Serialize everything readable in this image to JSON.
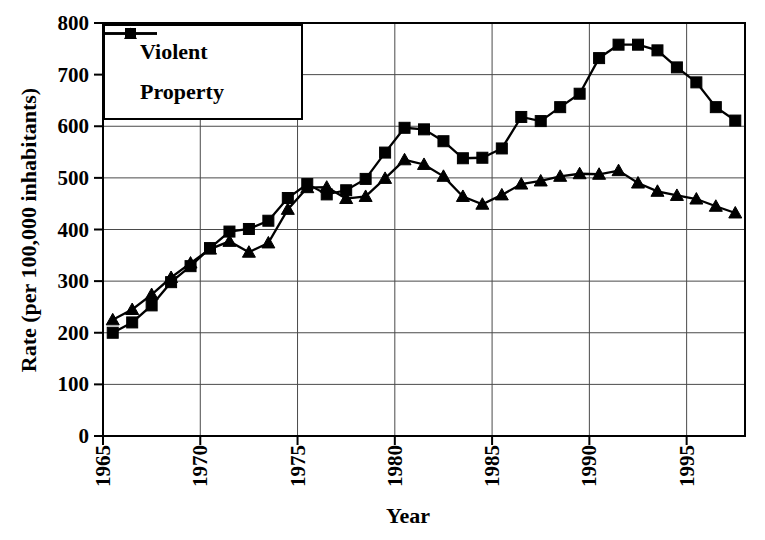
{
  "figure": {
    "background": "#ffffff",
    "line_color": "#000000",
    "grid_color": "#4a4a4a"
  },
  "legend": {
    "items": [
      {
        "label": "Violent",
        "marker": "square"
      },
      {
        "label": "Property",
        "marker": "triangle"
      }
    ]
  },
  "chart_data": {
    "type": "line",
    "title": "",
    "xlabel": "Year",
    "ylabel": "Rate (per 100,000 inhabitants)",
    "ylim": [
      0,
      800
    ],
    "yticks": [
      0,
      100,
      200,
      300,
      400,
      500,
      600,
      700,
      800
    ],
    "xticks": [
      1965,
      1970,
      1975,
      1980,
      1985,
      1990,
      1995
    ],
    "grid": true,
    "legend_position": "top-left-inside",
    "x": [
      1965,
      1966,
      1967,
      1968,
      1969,
      1970,
      1971,
      1972,
      1973,
      1974,
      1975,
      1976,
      1977,
      1978,
      1979,
      1980,
      1981,
      1982,
      1983,
      1984,
      1985,
      1986,
      1987,
      1988,
      1989,
      1990,
      1991,
      1992,
      1993,
      1994,
      1995,
      1996,
      1997
    ],
    "series": [
      {
        "name": "Violent",
        "marker": "square",
        "values": [
          200,
          220,
          253,
          298,
          329,
          364,
          396,
          401,
          417,
          461,
          488,
          468,
          476,
          498,
          549,
          597,
          594,
          571,
          538,
          539,
          557,
          618,
          610,
          637,
          663,
          732,
          758,
          758,
          747,
          714,
          685,
          637,
          611
        ]
      },
      {
        "name": "Property",
        "marker": "triangle",
        "values": [
          225,
          245,
          274,
          307,
          335,
          362,
          377,
          356,
          374,
          439,
          481,
          482,
          460,
          464,
          499,
          535,
          526,
          503,
          464,
          449,
          467,
          488,
          494,
          503,
          508,
          507,
          514,
          490,
          474,
          466,
          459,
          445,
          432
        ]
      }
    ]
  }
}
